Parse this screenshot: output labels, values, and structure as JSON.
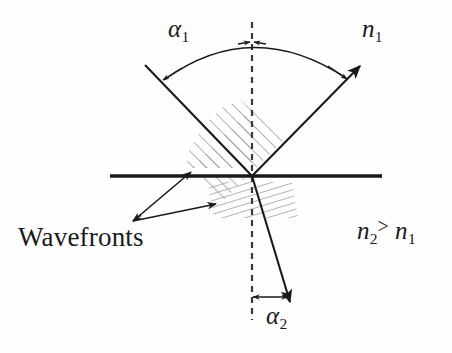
{
  "figure": {
    "background_color": "#fefefe",
    "ink_color": "#1a1a1a",
    "hatch_color": "#9a9a9a"
  },
  "labels": {
    "alpha1": {
      "symbol": "α",
      "subscript": "1",
      "text": "α1"
    },
    "alpha2": {
      "symbol": "α",
      "subscript": "2",
      "text": "α2"
    },
    "n1": {
      "symbol": "n",
      "subscript": "1",
      "text": "n1"
    },
    "n2_gt_n1": {
      "left_symbol": "n",
      "left_subscript": "2",
      "operator": ">",
      "right_symbol": "n",
      "right_subscript": "1",
      "text": "n2 > n1"
    },
    "wavefronts": {
      "text": "Wavefronts"
    }
  },
  "elements": {
    "interface_line": "interface-line",
    "normal_line": "normal-dashed-line",
    "incident_ray": "incident-ray",
    "reflected_ray": "reflected-ray",
    "refracted_ray": "refracted-ray",
    "angle_arc_alpha1": "angle-arc-alpha1",
    "angle_arrow_alpha2": "angle-arrow-alpha2",
    "hatch_upper": "wavefronts-hatch-incident",
    "hatch_lower": "wavefronts-hatch-refracted",
    "leader_upper": "wavefronts-leader-upper",
    "leader_lower": "wavefronts-leader-lower"
  },
  "geometry": {
    "origin": {
      "x": 252,
      "y": 176
    },
    "interface": {
      "x1": 110,
      "y1": 176,
      "x2": 382,
      "y2": 176
    },
    "normal": {
      "x": 252,
      "y_top": 22,
      "y_bottom": 320
    },
    "incident_ray": {
      "from_x": 145,
      "from_y": 65,
      "to_x": 252,
      "to_y": 176
    },
    "reflected_ray": {
      "from_x": 252,
      "from_y": 176,
      "to_x": 362,
      "to_y": 64
    },
    "refracted_ray": {
      "from_x": 252,
      "from_y": 176,
      "to_x": 291,
      "to_y": 303
    },
    "arc_alpha1": {
      "left_x": 162,
      "left_y": 80,
      "apex_x": 252,
      "apex_y": 42,
      "right_x": 347,
      "right_y": 78
    },
    "arrow_alpha2": {
      "from_x": 252,
      "from_y": 297,
      "to_x": 289,
      "to_y": 297
    }
  }
}
